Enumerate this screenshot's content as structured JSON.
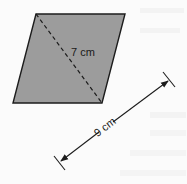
{
  "figure": {
    "shape": "rhombus",
    "fill_color": "#9c9c9c",
    "stroke_color": "#1c1c1c",
    "diagonal": {
      "label": "7 cm",
      "style": "dashed"
    },
    "side_measure": {
      "label": "9 cm",
      "style": "arrow-with-end-ticks"
    }
  },
  "background_text": {
    "visible": "faint bleed-through text (illegible)"
  }
}
